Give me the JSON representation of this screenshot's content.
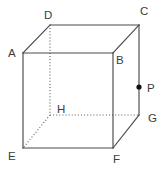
{
  "figure": {
    "background_color": "#ffffff",
    "edge_color": "#4a4a4a",
    "hidden_edge_color": "#5a5a5a",
    "label_color": "#3c3c3c",
    "point_color": "#111111",
    "vertices": {
      "A": {
        "label": "A",
        "x": 23,
        "y": 53,
        "label_x": 8,
        "label_y": 57
      },
      "B": {
        "label": "B",
        "x": 113,
        "y": 53,
        "label_x": 116,
        "label_y": 64
      },
      "C": {
        "label": "C",
        "x": 139,
        "y": 25,
        "label_x": 140,
        "label_y": 15
      },
      "D": {
        "label": "D",
        "x": 50,
        "y": 25,
        "label_x": 44,
        "label_y": 19
      },
      "E": {
        "label": "E",
        "x": 23,
        "y": 148,
        "label_x": 8,
        "label_y": 160
      },
      "F": {
        "label": "F",
        "x": 113,
        "y": 148,
        "label_x": 113,
        "label_y": 163
      },
      "G": {
        "label": "G",
        "x": 139,
        "y": 115,
        "label_x": 148,
        "label_y": 122
      },
      "H": {
        "label": "H",
        "x": 50,
        "y": 115,
        "label_x": 57,
        "label_y": 113
      }
    },
    "point": {
      "label": "P",
      "x": 139,
      "y": 87,
      "radius": 2.6,
      "label_x": 147,
      "label_y": 92
    },
    "solid_edges": [
      {
        "name": "edge-A-B",
        "from": "A",
        "to": "B"
      },
      {
        "name": "edge-A-E",
        "from": "A",
        "to": "E"
      },
      {
        "name": "edge-B-F",
        "from": "B",
        "to": "F"
      },
      {
        "name": "edge-E-F",
        "from": "E",
        "to": "F"
      },
      {
        "name": "edge-D-C",
        "from": "D",
        "to": "C"
      },
      {
        "name": "edge-A-D",
        "from": "A",
        "to": "D"
      },
      {
        "name": "edge-B-C",
        "from": "B",
        "to": "C"
      },
      {
        "name": "edge-C-G",
        "from": "C",
        "to": "G"
      },
      {
        "name": "edge-F-G",
        "from": "F",
        "to": "G"
      }
    ],
    "hidden_edges": [
      {
        "name": "edge-D-H",
        "from": "D",
        "to": "H"
      },
      {
        "name": "edge-H-E",
        "from": "H",
        "to": "E"
      },
      {
        "name": "edge-H-G",
        "from": "H",
        "to": "G"
      }
    ]
  }
}
